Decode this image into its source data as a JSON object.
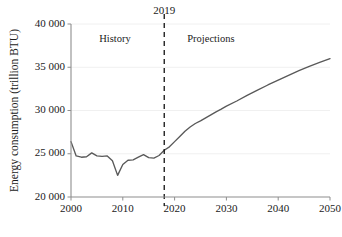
{
  "chart_data": {
    "type": "line",
    "title": "",
    "xlabel": "",
    "ylabel": "Energy consumption (trillion BTU)",
    "xlim": [
      2000,
      2050
    ],
    "ylim": [
      20000,
      40000
    ],
    "grid": true,
    "grid_axis": "y",
    "legend_position": "none",
    "x_ticks": [
      2000,
      2010,
      2020,
      2030,
      2040,
      2050
    ],
    "x_tick_labels": [
      "2000",
      "2010",
      "2020",
      "2030",
      "2040",
      "2050"
    ],
    "y_ticks": [
      20000,
      25000,
      30000,
      35000,
      40000
    ],
    "y_tick_labels": [
      "20 000",
      "25 000",
      "30 000",
      "35 000",
      "40 000"
    ],
    "series": [
      {
        "name": "History",
        "color": "#595959",
        "style": "solid",
        "x": [
          2000,
          2001,
          2002,
          2003,
          2004,
          2005,
          2006,
          2007,
          2008,
          2009,
          2010,
          2011,
          2012,
          2013,
          2014,
          2015,
          2016,
          2017,
          2018
        ],
        "values": [
          26400,
          24750,
          24600,
          24650,
          25100,
          24750,
          24700,
          24750,
          24200,
          22500,
          23750,
          24250,
          24300,
          24600,
          24900,
          24550,
          24500,
          24800,
          25400
        ]
      },
      {
        "name": "Projections",
        "color": "#595959",
        "style": "solid",
        "x": [
          2018,
          2019,
          2020,
          2021,
          2022,
          2023,
          2024,
          2025,
          2026,
          2027,
          2028,
          2029,
          2030,
          2032,
          2034,
          2036,
          2038,
          2040,
          2042,
          2044,
          2046,
          2048,
          2050
        ],
        "values": [
          25400,
          25800,
          26400,
          27000,
          27600,
          28100,
          28500,
          28800,
          29150,
          29500,
          29850,
          30150,
          30500,
          31100,
          31750,
          32350,
          32950,
          33500,
          34050,
          34600,
          35100,
          35550,
          36000
        ]
      }
    ],
    "annotations": [
      {
        "name": "history-label",
        "text": "History",
        "x": 2008.5,
        "y": 38200
      },
      {
        "name": "projections-label",
        "text": "Projections",
        "x": 2027,
        "y": 38200
      },
      {
        "name": "divider-label",
        "text": "2019",
        "x": 2018,
        "y": 41200
      }
    ],
    "divider": {
      "name": "history-projection-divider",
      "label": "2019",
      "x": 2018,
      "style": "dashed",
      "color": "#1a1a1a"
    },
    "colors": {
      "line": "#595959",
      "grid": "#ececec",
      "spine": "#8e8e8e",
      "divider": "#1a1a1a",
      "text": "#1a1a1a",
      "background": "#ffffff"
    }
  }
}
